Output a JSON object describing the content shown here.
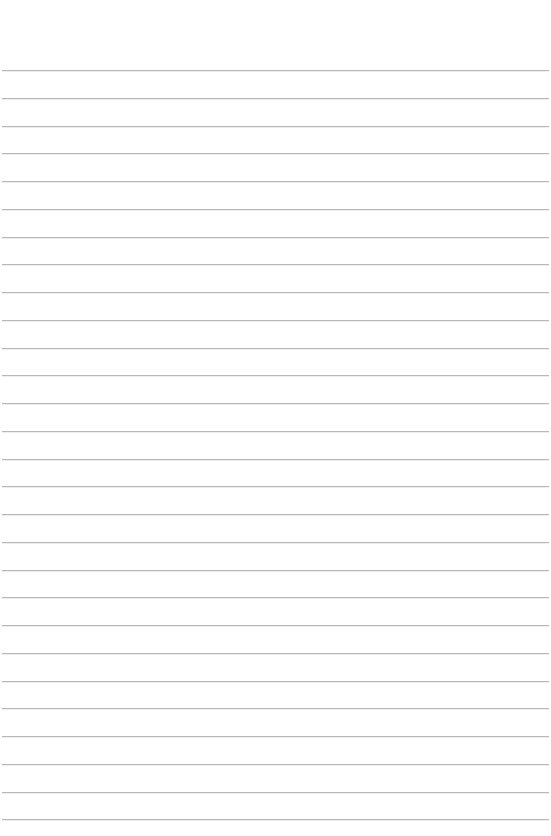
{
  "paper": {
    "type": "lined-paper",
    "background_color": "#ffffff",
    "line_color": "#b8b8b8",
    "line_count": 28,
    "first_line_y": 70,
    "line_spacing": 27.75
  }
}
